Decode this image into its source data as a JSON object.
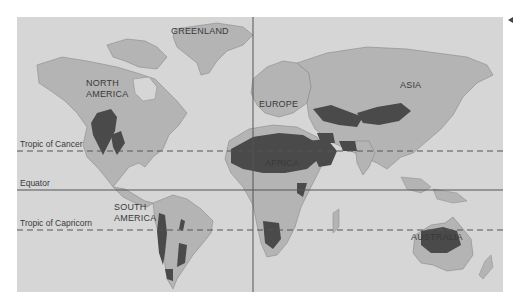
{
  "map": {
    "colors": {
      "ocean": "#d6d6d6",
      "land": "#b4b4b4",
      "desert": "#4a4a4a",
      "border": "#8a8a8a",
      "lines": "#555555"
    },
    "continents": [
      {
        "name": "GREENLAND"
      },
      {
        "name": "NORTH AMERICA",
        "line1": "NORTH",
        "line2": "AMERICA"
      },
      {
        "name": "EUROPE"
      },
      {
        "name": "ASIA"
      },
      {
        "name": "AFRICA"
      },
      {
        "name": "SOUTH AMERICA",
        "line1": "SOUTH",
        "line2": "AMERICA"
      },
      {
        "name": "AUSTRALIA"
      }
    ],
    "lines": {
      "tropic_cancer": "Tropic of Cancer",
      "equator": "Equator",
      "tropic_capricorn": "Tropic of Capricorn"
    },
    "side_marker": "◂"
  }
}
